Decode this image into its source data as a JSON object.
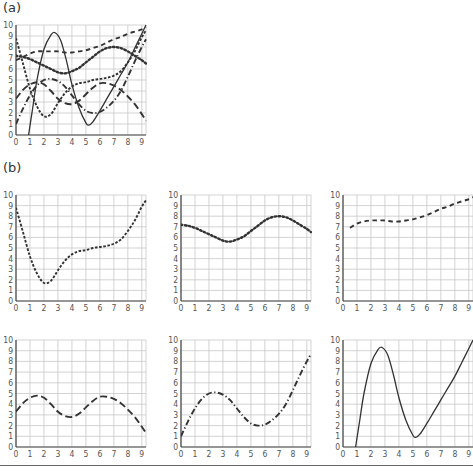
{
  "figure": {
    "panel_a_label": "(a)",
    "panel_b_label": "(b)",
    "colors": {
      "curve": "#333333",
      "grid": "#c8c8c8",
      "axis": "#444444",
      "tick_label": "#555555",
      "rule": "#666666"
    }
  },
  "chart_data": [
    {
      "panel": "a",
      "type": "line",
      "title": "",
      "xlabel": "",
      "ylabel": "",
      "x_ticks": [
        0,
        1,
        2,
        3,
        4,
        5,
        6,
        7,
        8,
        9
      ],
      "y_ticks": [
        0,
        1,
        2,
        3,
        4,
        5,
        6,
        7,
        8,
        9,
        10
      ],
      "xlim": [
        0,
        9.3
      ],
      "ylim": [
        0,
        10
      ],
      "grid": true,
      "legend": "none",
      "series": [
        {
          "name": "short-dash",
          "style": "dashed-short",
          "x": [
            0,
            0.5,
            1,
            1.5,
            2,
            2.5,
            3,
            3.5,
            4,
            4.5,
            5,
            5.5,
            6,
            6.5,
            7,
            7.5,
            8,
            8.5,
            9,
            9.3
          ],
          "values": [
            8.8,
            6.5,
            4.2,
            2.6,
            1.7,
            1.9,
            2.9,
            3.8,
            4.4,
            4.7,
            4.8,
            5.0,
            5.1,
            5.2,
            5.4,
            5.8,
            6.6,
            7.6,
            8.9,
            9.5
          ]
        },
        {
          "name": "dotted",
          "style": "dotted",
          "x": [
            0,
            0.5,
            1,
            1.5,
            2,
            2.5,
            3,
            3.5,
            4,
            4.5,
            5,
            5.5,
            6,
            6.5,
            7,
            7.5,
            8,
            8.5,
            9,
            9.3
          ],
          "values": [
            7.2,
            7.1,
            6.9,
            6.6,
            6.3,
            6.0,
            5.7,
            5.6,
            5.8,
            6.1,
            6.6,
            7.1,
            7.6,
            7.9,
            8.0,
            7.9,
            7.6,
            7.2,
            6.8,
            6.5
          ]
        },
        {
          "name": "medium-dash",
          "style": "dashed-medium",
          "x": [
            0,
            0.5,
            1,
            1.5,
            2,
            2.5,
            3,
            3.5,
            4,
            4.5,
            5,
            5.5,
            6,
            6.5,
            7,
            7.5,
            8,
            8.5,
            9,
            9.3
          ],
          "values": [
            6.8,
            7.1,
            7.4,
            7.6,
            7.6,
            7.6,
            7.6,
            7.5,
            7.5,
            7.6,
            7.7,
            7.9,
            8.1,
            8.4,
            8.7,
            8.9,
            9.2,
            9.4,
            9.6,
            9.8
          ]
        },
        {
          "name": "long-dash",
          "style": "dashed-long",
          "x": [
            0,
            0.5,
            1,
            1.5,
            2,
            2.5,
            3,
            3.5,
            4,
            4.5,
            5,
            5.5,
            6,
            6.5,
            7,
            7.5,
            8,
            8.5,
            9,
            9.3
          ],
          "values": [
            3.3,
            4.1,
            4.6,
            4.8,
            4.6,
            4.0,
            3.3,
            2.9,
            2.8,
            3.1,
            3.7,
            4.3,
            4.7,
            4.7,
            4.5,
            4.1,
            3.5,
            2.8,
            1.9,
            1.3
          ]
        },
        {
          "name": "dash-dot",
          "style": "dash-dot",
          "x": [
            0,
            0.5,
            1,
            1.5,
            2,
            2.5,
            3,
            3.5,
            4,
            4.5,
            5,
            5.5,
            6,
            6.5,
            7,
            7.5,
            8,
            8.5,
            9,
            9.3
          ],
          "values": [
            1.0,
            2.4,
            3.6,
            4.5,
            5.0,
            5.1,
            4.9,
            4.4,
            3.6,
            2.8,
            2.2,
            2.0,
            2.1,
            2.5,
            3.1,
            4.0,
            5.3,
            6.7,
            8.0,
            8.7
          ]
        },
        {
          "name": "solid",
          "style": "solid",
          "x": [
            0.9,
            1.2,
            1.5,
            2,
            2.5,
            2.8,
            3.2,
            3.6,
            4,
            4.5,
            5,
            5.2,
            5.5,
            6,
            6.5,
            7,
            7.5,
            8,
            8.5,
            9,
            9.3
          ],
          "values": [
            0,
            2.5,
            5,
            7.8,
            9.1,
            9.3,
            8.6,
            6.8,
            4.6,
            2.5,
            1.1,
            0.9,
            1.2,
            2.2,
            3.3,
            4.4,
            5.5,
            6.6,
            7.9,
            9.2,
            10
          ]
        }
      ]
    },
    {
      "panel": "b1",
      "type": "line",
      "style": "dashed-short",
      "x_ticks": [
        0,
        1,
        2,
        3,
        4,
        5,
        6,
        7,
        8,
        9
      ],
      "y_ticks": [
        0,
        1,
        2,
        3,
        4,
        5,
        6,
        7,
        8,
        9,
        10
      ],
      "xlim": [
        0,
        9.3
      ],
      "ylim": [
        0,
        10
      ],
      "grid": true,
      "x": [
        0,
        0.5,
        1,
        1.5,
        2,
        2.5,
        3,
        3.5,
        4,
        4.5,
        5,
        5.5,
        6,
        6.5,
        7,
        7.5,
        8,
        8.5,
        9,
        9.3
      ],
      "values": [
        8.8,
        6.5,
        4.2,
        2.6,
        1.7,
        1.9,
        2.9,
        3.8,
        4.4,
        4.7,
        4.8,
        5.0,
        5.1,
        5.2,
        5.4,
        5.8,
        6.6,
        7.6,
        8.9,
        9.5
      ]
    },
    {
      "panel": "b2",
      "type": "line",
      "style": "dotted",
      "x_ticks": [
        0,
        1,
        2,
        3,
        4,
        5,
        6,
        7,
        8,
        9
      ],
      "y_ticks": [
        0,
        1,
        2,
        3,
        4,
        5,
        6,
        7,
        8,
        9,
        10
      ],
      "xlim": [
        0,
        9.3
      ],
      "ylim": [
        0,
        10
      ],
      "grid": true,
      "x": [
        0,
        0.5,
        1,
        1.5,
        2,
        2.5,
        3,
        3.5,
        4,
        4.5,
        5,
        5.5,
        6,
        6.5,
        7,
        7.5,
        8,
        8.5,
        9,
        9.3
      ],
      "values": [
        7.2,
        7.1,
        6.9,
        6.6,
        6.3,
        6.0,
        5.7,
        5.6,
        5.8,
        6.1,
        6.6,
        7.1,
        7.6,
        7.9,
        8.0,
        7.9,
        7.6,
        7.2,
        6.8,
        6.5
      ]
    },
    {
      "panel": "b3",
      "type": "line",
      "style": "dashed-medium",
      "x_ticks": [
        0,
        1,
        2,
        3,
        4,
        5,
        6,
        7,
        8,
        9
      ],
      "y_ticks": [
        0,
        1,
        2,
        3,
        4,
        5,
        6,
        7,
        8,
        9,
        10
      ],
      "xlim": [
        0,
        9.3
      ],
      "ylim": [
        0,
        10
      ],
      "grid": true,
      "x": [
        0.5,
        1,
        1.5,
        2,
        2.5,
        3,
        3.5,
        4,
        4.5,
        5,
        5.5,
        6,
        6.5,
        7,
        7.5,
        8,
        8.5,
        9,
        9.3
      ],
      "values": [
        6.9,
        7.3,
        7.5,
        7.6,
        7.6,
        7.6,
        7.5,
        7.5,
        7.6,
        7.7,
        7.9,
        8.1,
        8.4,
        8.7,
        8.9,
        9.2,
        9.4,
        9.6,
        9.8
      ]
    },
    {
      "panel": "b4",
      "type": "line",
      "style": "dashed-long",
      "x_ticks": [
        0,
        1,
        2,
        3,
        4,
        5,
        6,
        7,
        8,
        9
      ],
      "y_ticks": [
        0,
        1,
        2,
        3,
        4,
        5,
        6,
        7,
        8,
        9,
        10
      ],
      "xlim": [
        0,
        9.3
      ],
      "ylim": [
        0,
        10
      ],
      "grid": true,
      "x": [
        0,
        0.5,
        1,
        1.5,
        2,
        2.5,
        3,
        3.5,
        4,
        4.5,
        5,
        5.5,
        6,
        6.5,
        7,
        7.5,
        8,
        8.5,
        9,
        9.3
      ],
      "values": [
        3.3,
        4.1,
        4.6,
        4.8,
        4.6,
        4.0,
        3.3,
        2.9,
        2.8,
        3.1,
        3.7,
        4.3,
        4.7,
        4.7,
        4.5,
        4.1,
        3.5,
        2.8,
        1.9,
        1.3
      ]
    },
    {
      "panel": "b5",
      "type": "line",
      "style": "dash-dot",
      "x_ticks": [
        0,
        1,
        2,
        3,
        4,
        5,
        6,
        7,
        8,
        9
      ],
      "y_ticks": [
        0,
        1,
        2,
        3,
        4,
        5,
        6,
        7,
        8,
        9,
        10
      ],
      "xlim": [
        0,
        9.3
      ],
      "ylim": [
        0,
        10
      ],
      "grid": true,
      "x": [
        0,
        0.5,
        1,
        1.5,
        2,
        2.5,
        3,
        3.5,
        4,
        4.5,
        5,
        5.5,
        6,
        6.5,
        7,
        7.5,
        8,
        8.5,
        9,
        9.3
      ],
      "values": [
        1.0,
        2.4,
        3.6,
        4.5,
        5.0,
        5.1,
        4.9,
        4.4,
        3.6,
        2.8,
        2.2,
        2.0,
        2.1,
        2.5,
        3.1,
        4.0,
        5.3,
        6.7,
        8.0,
        8.7
      ]
    },
    {
      "panel": "b6",
      "type": "line",
      "style": "solid",
      "x_ticks": [
        0,
        1,
        2,
        3,
        4,
        5,
        6,
        7,
        8,
        9
      ],
      "y_ticks": [
        0,
        1,
        2,
        3,
        4,
        5,
        6,
        7,
        8,
        9,
        10
      ],
      "xlim": [
        0,
        9.3
      ],
      "ylim": [
        0,
        10
      ],
      "grid": true,
      "x": [
        0.9,
        1.2,
        1.5,
        2,
        2.5,
        2.8,
        3.2,
        3.6,
        4,
        4.5,
        5,
        5.2,
        5.5,
        6,
        6.5,
        7,
        7.5,
        8,
        8.5,
        9,
        9.3
      ],
      "values": [
        0,
        2.5,
        5,
        7.8,
        9.1,
        9.3,
        8.6,
        6.8,
        4.6,
        2.5,
        1.1,
        0.9,
        1.2,
        2.2,
        3.3,
        4.4,
        5.5,
        6.6,
        7.9,
        9.2,
        10
      ]
    }
  ]
}
